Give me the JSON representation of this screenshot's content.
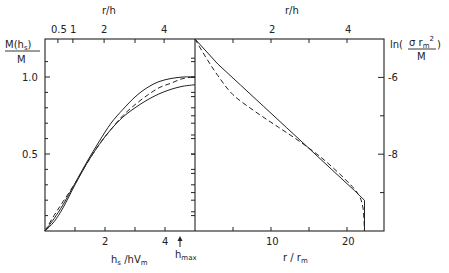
{
  "chart_data": [
    {
      "type": "line",
      "panel": "left",
      "xlabel": "h_s / hV_m",
      "ylabel": "M(h_s) / M",
      "top_xlabel": "r/h",
      "xlim": [
        0,
        5
      ],
      "ylim": [
        0,
        1.25
      ],
      "x_ticks": [
        {
          "v": 2,
          "label": "2"
        },
        {
          "v": 4,
          "label": "4"
        }
      ],
      "x_minor_ticks": [
        1,
        3
      ],
      "y_ticks": [
        {
          "v": 0.5,
          "label": "0.5"
        },
        {
          "v": 1.0,
          "label": "1.0"
        }
      ],
      "y_minor_ticks": [
        0.1,
        0.2,
        0.3,
        0.4,
        0.6,
        0.7,
        0.8,
        0.9,
        1.1
      ],
      "top_ticks": [
        {
          "x": 0.43,
          "label": "0.5"
        },
        {
          "x": 0.93,
          "label": "1"
        },
        {
          "x": 1.97,
          "label": "2"
        },
        {
          "x": 3.0,
          "label": ""
        },
        {
          "x": 3.97,
          "label": "4"
        }
      ],
      "annotation": {
        "text": "h",
        "sub": "max",
        "x": 4.45,
        "arrow": "up"
      },
      "series": [
        {
          "name": "solid-upper",
          "style": "solid",
          "x": [
            0,
            0.3,
            0.6,
            1.0,
            1.4,
            1.8,
            2.2,
            2.6,
            3.0,
            3.4,
            3.8,
            4.2,
            4.6,
            5.0
          ],
          "y": [
            0,
            0.08,
            0.17,
            0.31,
            0.45,
            0.58,
            0.7,
            0.79,
            0.87,
            0.93,
            0.97,
            0.99,
            1.0,
            1.0
          ]
        },
        {
          "name": "dashed",
          "style": "dashed",
          "x": [
            0,
            0.3,
            0.6,
            1.0,
            1.4,
            1.8,
            2.2,
            2.6,
            3.0,
            3.4,
            3.8,
            4.2,
            4.6,
            5.0
          ],
          "y": [
            0,
            0.1,
            0.19,
            0.31,
            0.44,
            0.56,
            0.66,
            0.75,
            0.82,
            0.88,
            0.93,
            0.96,
            0.99,
            1.0
          ]
        },
        {
          "name": "solid-lower",
          "style": "solid",
          "x": [
            0,
            0.3,
            0.6,
            1.0,
            1.4,
            1.8,
            2.2,
            2.6,
            3.0,
            3.4,
            3.8,
            4.2,
            4.6,
            5.0
          ],
          "y": [
            0,
            0.06,
            0.15,
            0.3,
            0.44,
            0.56,
            0.66,
            0.74,
            0.8,
            0.85,
            0.89,
            0.92,
            0.94,
            0.95
          ]
        }
      ]
    },
    {
      "type": "line",
      "panel": "right",
      "xlabel": "r / r_m",
      "ylabel": "ln(σ r_m² / M)",
      "top_xlabel": "r/h",
      "xlim": [
        0,
        24.9
      ],
      "ylim": [
        -10,
        -5
      ],
      "x_ticks": [
        {
          "v": 10,
          "label": "10"
        },
        {
          "v": 20,
          "label": "20"
        }
      ],
      "x_minor_ticks": [
        5,
        15
      ],
      "y_ticks": [
        {
          "v": -6,
          "label": "-6"
        },
        {
          "v": -8,
          "label": "-8"
        }
      ],
      "y_minor_ticks": [
        -7,
        -9
      ],
      "left_minor_ticks": [
        -5.5,
        -6,
        -6.5,
        -7,
        -7.5,
        -8,
        -8.5,
        -9,
        -9.5
      ],
      "top_ticks": [
        {
          "x": 5,
          "label": ""
        },
        {
          "x": 10,
          "label": "2"
        },
        {
          "x": 15,
          "label": ""
        },
        {
          "x": 20,
          "label": "4"
        }
      ],
      "series": [
        {
          "name": "solid",
          "style": "solid",
          "x": [
            0,
            3,
            6,
            9,
            12,
            15,
            18,
            21,
            22.3,
            22.3
          ],
          "y": [
            -5,
            -5.65,
            -6.2,
            -6.75,
            -7.3,
            -7.85,
            -8.4,
            -8.95,
            -9.2,
            -10
          ]
        },
        {
          "name": "dashed",
          "style": "dashed",
          "x": [
            0,
            1.5,
            3,
            5,
            8,
            11,
            14,
            17,
            20,
            21.5,
            22.1,
            22.3
          ],
          "y": [
            -5,
            -5.5,
            -5.95,
            -6.45,
            -6.9,
            -7.3,
            -7.7,
            -8.15,
            -8.7,
            -9.05,
            -9.4,
            -10
          ]
        }
      ]
    }
  ],
  "labels": {
    "left_ylabel_num": "M(h",
    "left_ylabel_sub": "s",
    "left_ylabel_close": ")",
    "left_ylabel_den": "M",
    "left_y_1": "1.0",
    "left_y_05": "0.5",
    "left_x_2": "2",
    "left_x_4": "4",
    "left_xlabel_h": "h",
    "left_xlabel_s": "s",
    "left_xlabel_rest": " /hV",
    "left_xlabel_m": "m",
    "hmax_h": "h",
    "hmax_sub": "max",
    "top_rh_left": "r/h",
    "top_05": "0.5",
    "top_1": "1",
    "top_2": "2",
    "top_4": "4",
    "top_rh_right": "r/h",
    "top_r2": "2",
    "top_r4": "4",
    "right_ylabel_ln": "ln(",
    "right_ylabel_num": "σ r",
    "right_ylabel_m": "m",
    "right_ylabel_sq": "2",
    "right_ylabel_den": "M",
    "right_ylabel_close": ")",
    "right_y_6": "-6",
    "right_y_8": "-8",
    "right_x_10": "10",
    "right_x_20": "20",
    "right_xlabel_r": "r / r",
    "right_xlabel_m": "m"
  }
}
